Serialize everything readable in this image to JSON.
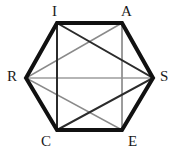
{
  "figure": {
    "type": "geometry-diagram",
    "shape": "hexagon-with-inscribed-triangles",
    "background_color": "#ffffff",
    "canvas": {
      "width": 178,
      "height": 156
    },
    "vertices": [
      {
        "id": "I",
        "label": "I",
        "x": 57,
        "y": 23,
        "label_x": 52,
        "label_y": 6
      },
      {
        "id": "A",
        "label": "A",
        "x": 122,
        "y": 23,
        "label_x": 122,
        "label_y": 6
      },
      {
        "id": "S",
        "label": "S",
        "x": 153,
        "y": 78,
        "label_x": 160,
        "label_y": 70
      },
      {
        "id": "E",
        "label": "E",
        "x": 122,
        "y": 130,
        "label_x": 128,
        "label_y": 135
      },
      {
        "id": "C",
        "label": "C",
        "x": 57,
        "y": 130,
        "label_x": 42,
        "label_y": 135
      },
      {
        "id": "R",
        "label": "R",
        "x": 26,
        "y": 78,
        "label_x": 8,
        "label_y": 70
      }
    ],
    "edges": {
      "hexagon_outline": {
        "name": "hexagon-outline",
        "points": "57,23 122,23 153,78 122,130 57,130 26,78",
        "color": "#111111",
        "width": 4
      },
      "triangle_dark": {
        "name": "triangle-ISC",
        "label": "I-S-C",
        "points": "57,23 153,78 57,130",
        "color": "#2b2b2b",
        "width": 2
      },
      "triangle_light": {
        "name": "triangle-ARE",
        "label": "A-R-E",
        "points": "122,23 26,78 122,130",
        "color": "#8a8a8a",
        "width": 1.5
      },
      "vertical_left": {
        "name": "segment-IC",
        "x1": 57,
        "y1": 23,
        "x2": 57,
        "y2": 130,
        "color": "#a8a8a8",
        "width": 1
      },
      "vertical_right": {
        "name": "segment-AE",
        "x1": 122,
        "y1": 23,
        "x2": 122,
        "y2": 130,
        "color": "#a8a8a8",
        "width": 1
      },
      "chord_RS": {
        "name": "segment-RS",
        "x1": 26,
        "y1": 78,
        "x2": 153,
        "y2": 78,
        "color": "#6d6d6d",
        "width": 1.2
      }
    }
  }
}
